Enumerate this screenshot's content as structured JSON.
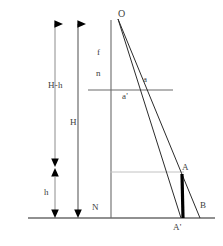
{
  "figure": {
    "type": "geometric-optics-diagram",
    "background_color": "#ffffff",
    "stroke_color": "#595959",
    "accent_color": "#000000",
    "faint_color": "#b5b5b5"
  },
  "labels": {
    "apex": "O",
    "focal": "f",
    "near": "n",
    "image_upper": "a",
    "image_lower": "a'",
    "height_total": "H",
    "height_diff": "H-h",
    "height_small": "h",
    "nodal": "N",
    "object_top": "A",
    "object_bottom": "A'",
    "ray_end": "B"
  },
  "geometry": {
    "baseline_y": 218,
    "axis_x": 111,
    "apex_x": 118,
    "apex_y": 18,
    "cross_line_y": 90,
    "cross_line_x1": 88,
    "cross_line_x2": 173,
    "faint_line_y": 172,
    "faint_line_x1": 110,
    "faint_line_x2": 185,
    "bar_x": 182,
    "bar_top_y": 174,
    "bar_bottom_y": 218,
    "arrow_left_x": 55,
    "arrow_right_x": 78,
    "arrow_top_y": 20,
    "hh_bottom_y": 165,
    "h_top_y": 171
  }
}
